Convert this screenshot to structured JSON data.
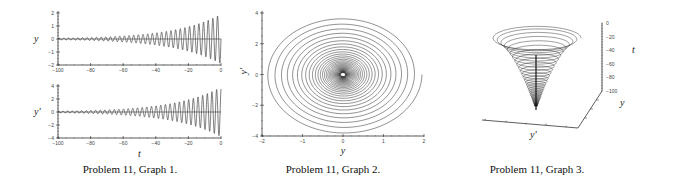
{
  "captions": {
    "graph1": "Problem 11, Graph 1.",
    "graph2": "Problem 11, Graph 2.",
    "graph3": "Problem 11, Graph 3."
  },
  "chart_data": [
    {
      "type": "line",
      "title": "Problem 11, Graph 1.",
      "panels": [
        {
          "ylabel": "y",
          "xlabel": "",
          "xlim": [
            -100,
            0
          ],
          "ylim": [
            -2,
            2
          ],
          "xticks": [
            -100,
            -80,
            -60,
            -40,
            -20,
            0
          ],
          "yticks": [
            -2,
            -1,
            0,
            1,
            2
          ],
          "description": "Oscillation with amplitude growing from ~0 at t=-100 to ~2 at t=0"
        },
        {
          "ylabel": "y'",
          "xlabel": "t",
          "xlim": [
            -100,
            0
          ],
          "ylim": [
            -4,
            4
          ],
          "xticks": [
            -100,
            -80,
            -60,
            -40,
            -20,
            0
          ],
          "yticks": [
            -4,
            -2,
            0,
            2,
            4
          ],
          "description": "Oscillation with amplitude growing from ~0 at t=-100 to ~4 at t=0"
        }
      ]
    },
    {
      "type": "line",
      "title": "Problem 11, Graph 2.",
      "xlabel": "y",
      "ylabel": "y'",
      "xlim": [
        -2,
        2
      ],
      "ylim": [
        -4,
        4
      ],
      "xticks": [
        -2,
        -1,
        0,
        1,
        2
      ],
      "yticks": [
        -4,
        -2,
        0,
        2,
        4
      ],
      "description": "Phase-plane spiral outward from origin, outer radius ~2 in y and ~4 in y'"
    },
    {
      "type": "line",
      "title": "Problem 11, Graph 3.",
      "xlabel": "y'",
      "ylabel": "y",
      "zlabel": "t",
      "zlim": [
        -100,
        0
      ],
      "zticks": [
        0,
        -20,
        -40,
        -60,
        -80,
        -100
      ],
      "description": "3D helical funnel: spiral in (y, y') widening as t goes from -100 up to 0"
    }
  ]
}
